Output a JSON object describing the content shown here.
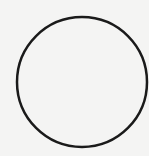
{
  "shape": {
    "type": "circle",
    "cx": 82,
    "cy": 82,
    "r": 65,
    "stroke": "#1a1a1a",
    "stroke_width": 2.5,
    "fill": "none"
  },
  "background": "#f4f4f3"
}
